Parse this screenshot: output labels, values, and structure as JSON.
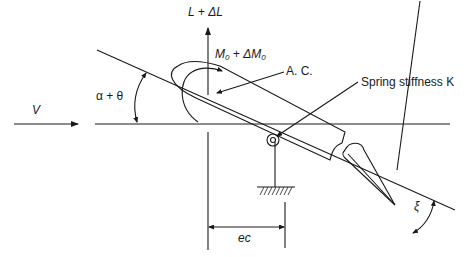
{
  "figure": {
    "stroke_color": "#1a1a1a",
    "background": "#ffffff"
  },
  "labels": {
    "lift": "L + ΔL",
    "moment_main": "M",
    "moment_sub": "0",
    "moment_plus": " + ΔM",
    "moment_sub2": "0",
    "aero_center": "A. C.",
    "spring": "Spring stiffness K",
    "velocity": "V",
    "angle_attack": "α + θ",
    "flap_angle": "ξ",
    "offset": "ec"
  }
}
